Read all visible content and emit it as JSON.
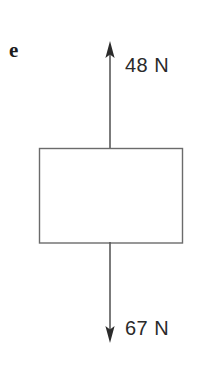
{
  "figure": {
    "part_label": "e",
    "background_color": "#ffffff",
    "stroke_color": "#555555",
    "text_color": "#2a2a2a",
    "canvas": {
      "width": 216,
      "height": 388
    },
    "body": {
      "shape_name": "rectangle",
      "x": 39,
      "y": 148,
      "width": 144,
      "height": 95,
      "fill": "#ffffff",
      "stroke": "#6b6b6b",
      "stroke_width": 1.4
    },
    "forces": [
      {
        "name": "upward-force",
        "label": "48 N",
        "magnitude": 48,
        "unit": "N",
        "direction": "up",
        "arrow_x": 110,
        "tip_y": 42,
        "tail_y": 149
      },
      {
        "name": "downward-force",
        "label": "67 N",
        "magnitude": 67,
        "unit": "N",
        "direction": "down",
        "arrow_x": 110,
        "tip_y": 342,
        "tail_y": 242
      }
    ]
  }
}
